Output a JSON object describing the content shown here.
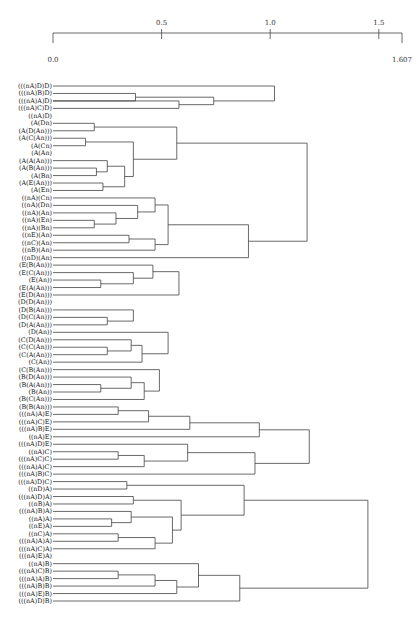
{
  "chart_data": {
    "type": "dendrogram",
    "title": "",
    "orientation": "horizontal, leaves on left, root on right",
    "axis": {
      "min": 0.0,
      "max": 1.607,
      "ticks": [
        0.5,
        1.0,
        1.5
      ],
      "tick_labels": [
        "0.5",
        "1.0",
        "1.5"
      ],
      "end_labels": [
        "0.0",
        "1.607"
      ]
    },
    "leaves": [
      "(((nA)D)D)",
      "(((nA)B)D)",
      "(((nA)A)D)",
      "(((nA)C)D)",
      "((nA)D)",
      "(A(Dn)",
      "(A(D(An)))",
      "(A(C(An)))",
      "(A(Cn)",
      "(A(An)",
      "(A(A(An)))",
      "(A(B(An)))",
      "(A(Bn)",
      "(A(E(An)))",
      "(A(En)",
      "((nA)(Cn)",
      "((nA)(Dn)",
      "((nA)(An)",
      "((nA)(En)",
      "((nA)(Bn)",
      "((nE)(An)",
      "((nC)(An)",
      "((nB)(An)",
      "((nD)(An)",
      "(E(B(An)))",
      "(E(C(An)))",
      "(E(An))",
      "(E(A(An)))",
      "(E(D(An)))",
      "(D(D(An)))",
      "(D(B(An)))",
      "(D(C(An)))",
      "(D(A(An)))",
      "(D(An))",
      "(C(D(An)))",
      "(C(C(An)))",
      "(C(A(An)))",
      "(C(An))",
      "(C(B(An)))",
      "(B(D(An)))",
      "(B(A(An)))",
      "(B(An))",
      "(B(C(An)))",
      "(B(B(An)))",
      "(((nA)A)E)",
      "(((nA)C)E)",
      "(((nA)B)E)",
      "((nA)E)",
      "(((nA)D)E)",
      "((nA)C)",
      "(((nA)C)C)",
      "(((nA)A)C)",
      "(((nA)B)C)",
      "(((nA)D)C)",
      "((nD)A)",
      "(((nA)D)A)",
      "((nB)A)",
      "(((nA)B)A)",
      "((nA)A)",
      "((nE)A)",
      "((nC)A)",
      "(((nA)A)A)",
      "(((nA)C)A)",
      "(((nA)E)A)",
      "((nA)B)",
      "(((nA)C)B)",
      "(((nA)A)B)",
      "(((nA)B)B)",
      "(((nA)E)B)",
      "(((nA)D)B)"
    ],
    "merges": [
      {
        "a": "L1",
        "b": "L2",
        "h": 0.38,
        "id": "m1"
      },
      {
        "a": "L2",
        "b": "L3",
        "h": 0.58,
        "id": "m2"
      },
      {
        "a": "m1",
        "b": "m2",
        "h": 0.74,
        "id": "m3"
      },
      {
        "a": "L0",
        "b": "m3",
        "h": 1.02,
        "id": "m4"
      },
      {
        "a": "L5",
        "b": "L6",
        "h": 0.19,
        "id": "m5"
      },
      {
        "a": "L7",
        "b": "L8",
        "h": 0.15,
        "id": "m6"
      },
      {
        "a": "L11",
        "b": "L12",
        "h": 0.2,
        "id": "m7"
      },
      {
        "a": "L13",
        "b": "L14",
        "h": 0.23,
        "id": "m8"
      },
      {
        "a": "L10",
        "b": "m7",
        "h": 0.25,
        "id": "m9"
      },
      {
        "a": "m8",
        "b": "m9",
        "h": 0.33,
        "id": "m10"
      },
      {
        "a": "m6",
        "b": "m10",
        "h": 0.37,
        "id": "m11"
      },
      {
        "a": "m5",
        "b": "m11",
        "h": 0.57,
        "id": "m12"
      },
      {
        "a": "L18",
        "b": "L19",
        "h": 0.19,
        "id": "m13"
      },
      {
        "a": "L17",
        "b": "m13",
        "h": 0.29,
        "id": "m14"
      },
      {
        "a": "L16",
        "b": "m14",
        "h": 0.39,
        "id": "m15"
      },
      {
        "a": "L15",
        "b": "m15",
        "h": 0.47,
        "id": "m16"
      },
      {
        "a": "L20",
        "b": "L21",
        "h": 0.35,
        "id": "m17"
      },
      {
        "a": "m17",
        "b": "L22",
        "h": 0.47,
        "id": "m18"
      },
      {
        "a": "m16",
        "b": "m18",
        "h": 0.53,
        "id": "m19"
      },
      {
        "a": "m19",
        "b": "L23",
        "h": 0.9,
        "id": "m20"
      },
      {
        "a": "m12",
        "b": "m20",
        "h": 1.17,
        "id": "m21"
      },
      {
        "a": "L26",
        "b": "L27",
        "h": 0.22,
        "id": "m22"
      },
      {
        "a": "m22",
        "b": "L25",
        "h": 0.37,
        "id": "m23"
      },
      {
        "a": "L24",
        "b": "m23",
        "h": 0.46,
        "id": "m24"
      },
      {
        "a": "m24",
        "b": "L28",
        "h": 0.58,
        "id": "m25"
      },
      {
        "a": "L31",
        "b": "L32",
        "h": 0.25,
        "id": "m26"
      },
      {
        "a": "L30",
        "b": "m26",
        "h": 0.37,
        "id": "m27"
      },
      {
        "a": "m27",
        "b": "L29_alt",
        "h": 0.4,
        "id": "m28"
      },
      {
        "a": "L29",
        "b": "m28",
        "h": 0.56,
        "id": "m29"
      },
      {
        "a": "L35",
        "b": "L36",
        "h": 0.25,
        "id": "m30"
      },
      {
        "a": "L34",
        "b": "m30",
        "h": 0.36,
        "id": "m31"
      },
      {
        "a": "m31",
        "b": "L37",
        "h": 0.41,
        "id": "m32"
      },
      {
        "a": "L33",
        "b": "m32",
        "h": 0.53,
        "id": "m33"
      },
      {
        "a": "m29",
        "b": "m33",
        "h": 0.94,
        "id": "m34"
      },
      {
        "a": "L40",
        "b": "L41",
        "h": 0.22,
        "id": "m35"
      },
      {
        "a": "L39",
        "b": "m35",
        "h": 0.36,
        "id": "m36"
      },
      {
        "a": "m36",
        "b": "L42",
        "h": 0.42,
        "id": "m37"
      },
      {
        "a": "L38",
        "b": "m37",
        "h": 0.49,
        "id": "m38"
      },
      {
        "a": "m34",
        "b": "m38",
        "h": 1.08,
        "id": "m39"
      },
      {
        "a": "m25",
        "b": "m39",
        "h": 1.22,
        "id": "m40"
      },
      {
        "a": "m21",
        "b": "m40",
        "h": 1.31,
        "id": "m41"
      },
      {
        "a": "L43",
        "b": "L44",
        "h": 0.3,
        "id": "m42"
      },
      {
        "a": "m42",
        "b": "L45",
        "h": 0.44,
        "id": "m43"
      },
      {
        "a": "m43",
        "b": "L46",
        "h": 0.63,
        "id": "m44"
      },
      {
        "a": "m44",
        "b": "L47",
        "h": 0.95,
        "id": "m45"
      },
      {
        "a": "L49",
        "b": "L50",
        "h": 0.3,
        "id": "m46"
      },
      {
        "a": "m46",
        "b": "L51",
        "h": 0.42,
        "id": "m47"
      },
      {
        "a": "L48",
        "b": "m47",
        "h": 0.62,
        "id": "m48"
      },
      {
        "a": "m48",
        "b": "L52",
        "h": 0.93,
        "id": "m49"
      },
      {
        "a": "m45",
        "b": "m49",
        "h": 1.18,
        "id": "m50"
      },
      {
        "a": "m41",
        "b": "m50",
        "h": 1.4,
        "id": "m51"
      },
      {
        "a": "L53",
        "b": "L54",
        "h": 0.34,
        "id": "m52"
      },
      {
        "a": "L55",
        "b": "L56",
        "h": 0.37,
        "id": "m53"
      },
      {
        "a": "L58",
        "b": "L59",
        "h": 0.27,
        "id": "m54"
      },
      {
        "a": "L57",
        "b": "m54",
        "h": 0.36,
        "id": "m55"
      },
      {
        "a": "L60",
        "b": "L61",
        "h": 0.3,
        "id": "m56"
      },
      {
        "a": "m56",
        "b": "L62",
        "h": 0.47,
        "id": "m57"
      },
      {
        "a": "m55",
        "b": "m57",
        "h": 0.55,
        "id": "m58"
      },
      {
        "a": "m53",
        "b": "m58",
        "h": 0.59,
        "id": "m59"
      },
      {
        "a": "m52",
        "b": "m59",
        "h": 0.88,
        "id": "m60"
      },
      {
        "a": "L65",
        "b": "L66",
        "h": 0.3,
        "id": "m61"
      },
      {
        "a": "m61",
        "b": "L67",
        "h": 0.47,
        "id": "m62"
      },
      {
        "a": "m62",
        "b": "L68",
        "h": 0.57,
        "id": "m63"
      },
      {
        "a": "L64",
        "b": "m63",
        "h": 0.67,
        "id": "m64"
      },
      {
        "a": "m64",
        "b": "L69",
        "h": 0.86,
        "id": "m65"
      },
      {
        "a": "m60",
        "b": "m65",
        "h": 1.45,
        "id": "m66"
      },
      {
        "a": "m4",
        "b": "m51",
        "h": 1.607,
        "id": "m67"
      },
      {
        "a": "m67",
        "b": "m66",
        "h": 1.607,
        "id": "root"
      }
    ]
  }
}
